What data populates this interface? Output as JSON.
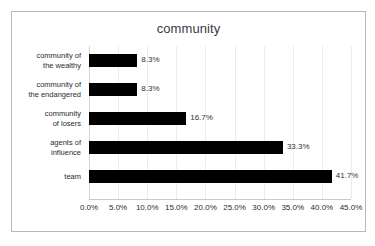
{
  "chart_data": {
    "type": "bar",
    "orientation": "horizontal",
    "title": "community",
    "xlabel": "",
    "ylabel": "",
    "categories": [
      "community of the wealthy",
      "community of the endangered",
      "community of losers",
      "agents of influence",
      "team"
    ],
    "category_lines": [
      [
        "community of",
        "the wealthy"
      ],
      [
        "community of",
        "the endangered"
      ],
      [
        "community",
        "of losers"
      ],
      [
        "agents of",
        "influence"
      ],
      [
        "team"
      ]
    ],
    "values": [
      8.3,
      8.3,
      16.7,
      33.3,
      41.7
    ],
    "value_labels": [
      "8.3%",
      "8.3%",
      "16.7%",
      "33.3%",
      "41.7%"
    ],
    "xlim": [
      0,
      45
    ],
    "xticks": [
      0,
      5,
      10,
      15,
      20,
      25,
      30,
      35,
      40,
      45
    ],
    "xtick_labels": [
      "0.0%",
      "5.0%",
      "10.0%",
      "15.0%",
      "20.0%",
      "25.0%",
      "30.0%",
      "35.0%",
      "40.0%",
      "45.0%"
    ],
    "grid": true,
    "legend": false,
    "bar_color": "#000000",
    "gridline_color": "#ececed",
    "border_color": "#b9b9b9",
    "text_color": "#2b2b2b"
  }
}
